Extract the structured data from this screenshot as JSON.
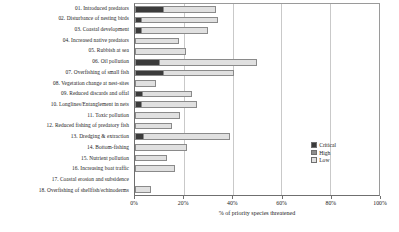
{
  "chart_data": {
    "type": "bar",
    "orientation": "horizontal",
    "stacked": true,
    "title": "",
    "xlabel": "% of priority species threatened",
    "ylabel": "",
    "xlim": [
      0,
      100
    ],
    "xticks": [
      0,
      20,
      40,
      60,
      80,
      100
    ],
    "xtick_labels": [
      "0%",
      "20%",
      "40%",
      "60%",
      "80%",
      "100%"
    ],
    "grid": "vertical",
    "legend_position": "right",
    "series": [
      {
        "name": "Critical",
        "color": "#3b3b3b",
        "values": [
          11.5,
          2.0,
          2.0,
          0.0,
          0.0,
          9.5,
          11.5,
          0.0,
          2.4,
          2.0,
          0.0,
          0.0,
          2.8,
          0.0,
          0.0,
          0.0,
          0.0,
          0.0
        ]
      },
      {
        "name": "High",
        "color": "#8e8e8e",
        "values": [
          0.0,
          0.0,
          0.0,
          0.0,
          0.0,
          0.0,
          0.0,
          0.0,
          0.0,
          0.0,
          0.0,
          0.0,
          0.0,
          0.0,
          0.0,
          0.0,
          0.0,
          0.0
        ]
      },
      {
        "name": "Low",
        "color": "#e0e0e0",
        "values": [
          21.8,
          32.0,
          28.0,
          18.2,
          20.8,
          40.5,
          29.0,
          8.8,
          21.0,
          23.5,
          18.5,
          15.0,
          36.0,
          21.5,
          13.0,
          16.5,
          0.0,
          6.5
        ]
      }
    ],
    "categories": [
      "01. Introduced predators",
      "02. Disturbance of nesting birds",
      "03. Coastal development",
      "04. Increased native predators",
      "05. Rubbish at sea",
      "06. Oil pollution",
      "07. Overfishing of small fish",
      "08. Vegetation change at nest-sites",
      "09. Reduced discards and offal",
      "10. Longlines/Entanglement in nets",
      "11. Toxic pollution",
      "12. Reduced fishing of predatory fish",
      "13. Dredging & extraction",
      "14. Bottom-fishing",
      "15. Nutrient pollution",
      "16. Increasing boat traffic",
      "17. Coastal erosion and subsidence",
      "18. Overfishing of shellfish/echinoderms"
    ],
    "totals": [
      33.3,
      34.0,
      30.0,
      18.2,
      20.8,
      50.0,
      40.5,
      8.8,
      23.4,
      25.5,
      18.5,
      15.0,
      38.8,
      21.5,
      13.0,
      16.5,
      0.0,
      6.5
    ]
  },
  "legend": {
    "items": [
      {
        "label": "Critical",
        "color": "#3b3b3b"
      },
      {
        "label": "High",
        "color": "#8e8e8e"
      },
      {
        "label": "Low",
        "color": "#e0e0e0"
      }
    ]
  }
}
